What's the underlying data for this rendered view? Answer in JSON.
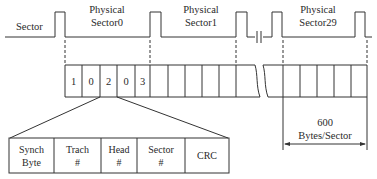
{
  "diagram": {
    "colors": {
      "line": "#333333",
      "text": "#2a2a2a",
      "background": "#ffffff"
    },
    "waveform": {
      "left_label": "Sector",
      "sector_labels": [
        {
          "line1": "Physical",
          "line2": "Sector0"
        },
        {
          "line1": "Physical",
          "line2": "Sector1"
        },
        {
          "line1": "Physical",
          "line2": "Sector29"
        }
      ],
      "gap_symbol": "capacitor-break-icon"
    },
    "byte_row": {
      "cells": [
        "1",
        "0",
        "2",
        "0",
        "3",
        "",
        "",
        "",
        "",
        "",
        "",
        "",
        "",
        "",
        "",
        "",
        ""
      ],
      "break_symbol": "wavy-break-icon"
    },
    "header_fields": [
      {
        "line1": "Synch",
        "line2": "Byte"
      },
      {
        "line1": "Trach",
        "line2": "#"
      },
      {
        "line1": "Head",
        "line2": "#"
      },
      {
        "line1": "Sector",
        "line2": "#"
      },
      {
        "line1": "CRC",
        "line2": ""
      }
    ],
    "dimension": {
      "value": "600",
      "unit": "Bytes/Sector"
    }
  }
}
